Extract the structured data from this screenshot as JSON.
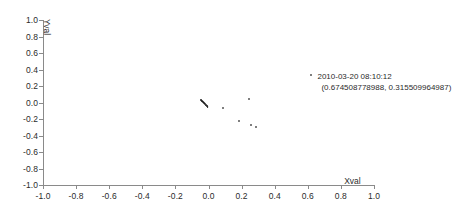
{
  "chart_data": {
    "type": "scatter",
    "title": "",
    "xlabel": "Xval",
    "ylabel": "Yval",
    "xlim": [
      -1.0,
      1.0
    ],
    "ylim": [
      -1.0,
      1.0
    ],
    "xticks": [
      "-1.0",
      "-0.8",
      "-0.6",
      "-0.4",
      "-0.2",
      "0.0",
      "0.2",
      "0.4",
      "0.6",
      "0.8",
      "1.0"
    ],
    "yticks": [
      "1.0",
      "0.8",
      "0.6",
      "0.4",
      "0.2",
      "0.0",
      "-0.2",
      "-0.4",
      "-0.6",
      "-0.8",
      "-1.0"
    ],
    "xtick_values": [
      -1.0,
      -0.8,
      -0.6,
      -0.4,
      -0.2,
      0.0,
      0.2,
      0.4,
      0.6,
      0.8,
      1.0
    ],
    "ytick_values": [
      1.0,
      0.8,
      0.6,
      0.4,
      0.2,
      0.0,
      -0.2,
      -0.4,
      -0.6,
      -0.8,
      -1.0
    ],
    "grid": false,
    "legend": false,
    "marker_color": "#555555",
    "cluster_color": "#1a1a1a",
    "axis_color": "#8a8a8a",
    "points": [
      {
        "x": -0.03,
        "y": -0.005,
        "size": 2.4,
        "dark": true
      },
      {
        "x": -0.036,
        "y": 0.005,
        "size": 2.4,
        "dark": true
      },
      {
        "x": -0.024,
        "y": -0.018,
        "size": 2.4,
        "dark": true
      },
      {
        "x": -0.042,
        "y": 0.018,
        "size": 2.2,
        "dark": true
      },
      {
        "x": -0.018,
        "y": -0.03,
        "size": 2.2,
        "dark": true
      },
      {
        "x": -0.048,
        "y": 0.03,
        "size": 2.0,
        "dark": true
      },
      {
        "x": -0.012,
        "y": -0.042,
        "size": 2.0,
        "dark": true
      },
      {
        "x": -0.006,
        "y": -0.054,
        "size": 1.8,
        "dark": true
      },
      {
        "x": 0.09,
        "y": -0.072,
        "size": 2.0,
        "dark": false
      },
      {
        "x": 0.243,
        "y": 0.043,
        "size": 2.0,
        "dark": false
      },
      {
        "x": 0.182,
        "y": -0.225,
        "size": 2.0,
        "dark": false
      },
      {
        "x": 0.255,
        "y": -0.268,
        "size": 2.0,
        "dark": false
      },
      {
        "x": 0.285,
        "y": -0.292,
        "size": 2.0,
        "dark": false
      },
      {
        "x": 0.622,
        "y": 0.328,
        "size": 2.0,
        "dark": false
      }
    ],
    "annotation": {
      "timestamp": "2010-03-20 08:10:12",
      "coordinates": "(0.674508778988, 0.315509964987)",
      "x": 0.622,
      "y": 0.328
    }
  }
}
